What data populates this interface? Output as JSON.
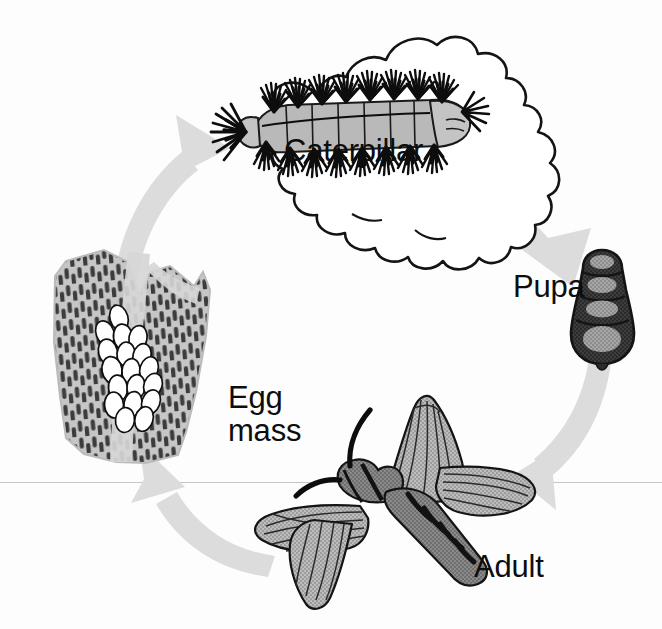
{
  "figure": {
    "background_color": "#fdfdfd",
    "baseline_rule_color": "#b9bdc0",
    "arrow_color": "#dcdcdc",
    "ink_color": "#111111"
  },
  "labels": {
    "caterpillar": "Caterpillar",
    "pupa": "Pupa",
    "egg_mass": "Egg\nmass",
    "egg_mass_line1": "Egg",
    "egg_mass_line2": "mass",
    "adult": "Adult"
  },
  "stages": [
    {
      "id": "egg-mass",
      "label": "Egg mass",
      "position": "left",
      "description": "Cluster of white oval eggs laid on tree bark",
      "egg_count_visible": 18,
      "colors": {
        "egg_fill": "#ffffff",
        "egg_outline": "#111111",
        "bark_light": "#c9c9c9",
        "bark_dark": "#3a3a3a"
      }
    },
    {
      "id": "caterpillar",
      "label": "Caterpillar",
      "position": "top",
      "description": "Hairy caterpillar with tufted black setae resting on an oak leaf",
      "colors": {
        "hair": "#111111",
        "body": "#b8b8b8",
        "leaf_outline": "#111111",
        "leaf_fill": "#ffffff"
      }
    },
    {
      "id": "pupa",
      "label": "Pupa",
      "position": "right",
      "description": "Dark segmented cone-shaped pupal case with four lighter segment patches",
      "segments": 4,
      "colors": {
        "shell": "#3b3b3b",
        "patch": "#9a9a9a"
      }
    },
    {
      "id": "adult",
      "label": "Adult",
      "position": "bottom",
      "description": "Adult moth with spread gray wings, dark banded abdomen and long antennae",
      "colors": {
        "wing": "#b2b2b2",
        "body": "#6e6e6e",
        "bands": "#1a1a1a",
        "antennae": "#111111"
      }
    }
  ],
  "arrows": [
    {
      "id": "arrow-egg-to-caterpillar",
      "from": "egg-mass",
      "to": "caterpillar",
      "direction": "up-right",
      "color": "#dcdcdc"
    },
    {
      "id": "arrow-caterpillar-to-pupa",
      "from": "caterpillar",
      "to": "pupa",
      "direction": "down-right",
      "color": "#dcdcdc"
    },
    {
      "id": "arrow-pupa-to-adult",
      "from": "pupa",
      "to": "adult",
      "direction": "down-left",
      "color": "#dcdcdc"
    },
    {
      "id": "arrow-adult-to-egg",
      "from": "adult",
      "to": "egg-mass",
      "direction": "up-left",
      "color": "#dcdcdc"
    }
  ],
  "rules": [
    {
      "id": "baseline",
      "orientation": "horizontal",
      "y": 482,
      "color": "#b9bdc0"
    }
  ]
}
